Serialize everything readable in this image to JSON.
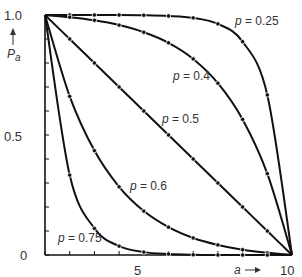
{
  "chart_data": {
    "type": "line",
    "title": "",
    "xlabel": "a",
    "ylabel": "P_a",
    "xlim": [
      0,
      10
    ],
    "ylim": [
      0,
      1.0
    ],
    "grid": false,
    "legend": "inline labels",
    "x_ticks": [
      0,
      1,
      2,
      3,
      4,
      5,
      6,
      7,
      8,
      9,
      10
    ],
    "x_tick_labels": [
      {
        "x": 5,
        "label": "5"
      },
      {
        "x": 10,
        "label": "10"
      }
    ],
    "y_ticks": [
      0,
      0.1,
      0.2,
      0.3,
      0.4,
      0.5,
      0.6,
      0.7,
      0.8,
      0.9,
      1.0
    ],
    "y_tick_labels": [
      {
        "y": 0,
        "label": "0"
      },
      {
        "y": 0.5,
        "label": "0.5"
      },
      {
        "y": 1.0,
        "label": "1.0"
      }
    ],
    "x": [
      0,
      1,
      2,
      3,
      4,
      5,
      6,
      7,
      8,
      9,
      10
    ],
    "series": [
      {
        "name": "p = 0.25",
        "values": [
          1.0,
          1.0,
          1.0,
          1.0,
          0.999,
          0.996,
          0.988,
          0.963,
          0.889,
          0.667,
          0.0
        ],
        "label_pos": [
          8.6,
          0.965
        ]
      },
      {
        "name": "p = 0.4",
        "values": [
          1.0,
          0.991,
          0.978,
          0.958,
          0.928,
          0.884,
          0.817,
          0.716,
          0.565,
          0.339,
          0.0
        ],
        "label_pos": [
          7.1,
          0.755
        ]
      },
      {
        "name": "p = 0.5",
        "values": [
          1.0,
          0.9,
          0.8,
          0.7,
          0.6,
          0.5,
          0.4,
          0.3,
          0.2,
          0.1,
          0.0
        ],
        "label_pos": [
          5.6,
          0.58
        ]
      },
      {
        "name": "p = 0.6",
        "values": [
          1.0,
          0.661,
          0.435,
          0.284,
          0.183,
          0.116,
          0.071,
          0.042,
          0.022,
          0.009,
          0.0
        ],
        "label_pos": [
          3.1,
          0.315
        ]
      },
      {
        "name": "p = 0.75",
        "values": [
          1.0,
          0.333,
          0.111,
          0.037,
          0.012,
          0.004,
          0.001,
          0.0,
          0.0,
          0.0,
          0.0
        ],
        "label_pos": [
          0.6,
          0.11
        ]
      }
    ]
  },
  "labels": {
    "y_axis": "P",
    "y_axis_sub": "a",
    "x_axis": "a",
    "tick_0": "0",
    "tick_05": "0.5",
    "tick_10": "1.0",
    "tick_x5": "5",
    "tick_x10": "10",
    "p025": "p = 0.25",
    "p04": "p = 0.4",
    "p05": "p = 0.5",
    "p06": "p = 0.6",
    "p075": "p = 0.75"
  },
  "colors": {
    "line": "#111111",
    "axis": "#111111",
    "text": "#333333"
  }
}
